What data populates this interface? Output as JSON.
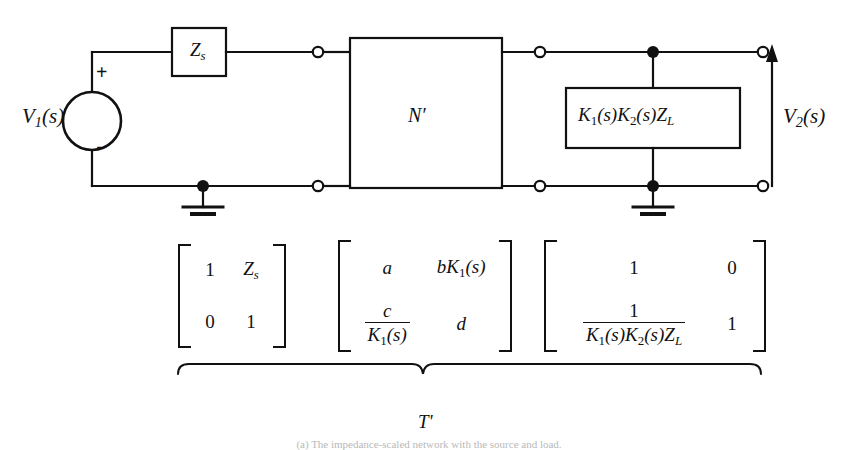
{
  "figure": {
    "caption": "(a) The impedance-scaled network with the source and load.",
    "overall_label": "T'"
  },
  "circuit": {
    "source": {
      "label": "V",
      "label_sub": "1",
      "label_arg": "(s)",
      "plus_sign": "+",
      "minus_sign": "−"
    },
    "series_impedance": {
      "label": "Z",
      "label_sub": "s"
    },
    "two_port": {
      "label": "N",
      "prime": "′"
    },
    "load": {
      "label": "K₁(s)K₂(s)Zₗ",
      "parts": [
        "K",
        "1",
        "(s)",
        "K",
        "2",
        "(s)",
        "Z",
        "L"
      ]
    },
    "output": {
      "label": "V",
      "label_sub": "2",
      "label_arg": "(s)"
    },
    "terminals": {
      "open_count": 6,
      "junction_count": 3
    },
    "grounds": 2
  },
  "matrices": [
    {
      "name": "source-matrix",
      "cells": [
        {
          "type": "plain",
          "text": "1"
        },
        {
          "type": "sub",
          "base": "Z",
          "sub": "s"
        },
        {
          "type": "plain",
          "text": "0"
        },
        {
          "type": "plain",
          "text": "1"
        }
      ]
    },
    {
      "name": "network-matrix",
      "cells": [
        {
          "type": "plain",
          "text": "a"
        },
        {
          "type": "expr",
          "text": "bK₁(s)"
        },
        {
          "type": "frac",
          "num": "c",
          "den": "K₁(s)"
        },
        {
          "type": "plain",
          "text": "d"
        }
      ]
    },
    {
      "name": "load-matrix",
      "cells": [
        {
          "type": "plain",
          "text": "1"
        },
        {
          "type": "plain",
          "text": "0"
        },
        {
          "type": "frac",
          "num": "1",
          "den": "K₁(s)K₂(s)Zₗ"
        },
        {
          "type": "plain",
          "text": "1"
        }
      ]
    }
  ],
  "colors": {
    "line": "#111111",
    "background": "#ffffff",
    "caption_text": "#b9b9b9"
  }
}
